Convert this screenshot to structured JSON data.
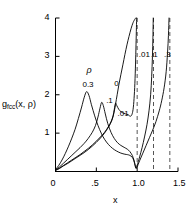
{
  "chart_data": {
    "type": "line",
    "title": "",
    "xlabel": "x",
    "ylabel": "g_fcc(x, ρ)",
    "ylabel_base": "g",
    "ylabel_sub": "fcc",
    "ylabel_args": "(x, ρ)",
    "xlim": [
      0,
      1.5
    ],
    "ylim": [
      0,
      4
    ],
    "xticks": [
      0,
      0.5,
      1.0,
      1.5
    ],
    "xtick_labels": [
      "0",
      ".5",
      "1.0",
      "1.5"
    ],
    "yticks": [
      0,
      1,
      2,
      3,
      4
    ],
    "ytick_labels": [
      "",
      "1",
      "2",
      "3",
      "4"
    ],
    "grid": false,
    "legend_position": "inline-annotations",
    "legend_title": "ρ",
    "annotations": [
      {
        "text": "ρ",
        "x": 0.38,
        "y": 2.62
      },
      {
        "text": "0.3",
        "x": 0.33,
        "y": 2.22
      },
      {
        "text": ".1",
        "x": 0.62,
        "y": 1.82
      },
      {
        "text": ".01",
        "x": 0.76,
        "y": 1.47
      },
      {
        "text": "0",
        "x": 0.72,
        "y": 2.25
      },
      {
        "text": ".01",
        "x": 1.02,
        "y": 3.02
      },
      {
        "text": ".1",
        "x": 1.17,
        "y": 3.02
      },
      {
        "text": ".3",
        "x": 1.33,
        "y": 3.02
      }
    ],
    "asymptotes": [
      {
        "label": ".01",
        "x": 1.0,
        "style": "dashed"
      },
      {
        "label": ".1",
        "x": 1.2,
        "style": "dashed"
      },
      {
        "label": ".3",
        "x": 1.4,
        "style": "dashed"
      }
    ],
    "series": [
      {
        "name": "ρ = 0.3",
        "label": "0.3",
        "rho": 0.3,
        "peak_x": 0.38,
        "peak_y": 2.08,
        "asymptote_x": 1.4,
        "points": [
          [
            0.0,
            0.05
          ],
          [
            0.04,
            0.16
          ],
          [
            0.08,
            0.3
          ],
          [
            0.12,
            0.47
          ],
          [
            0.16,
            0.66
          ],
          [
            0.2,
            0.87
          ],
          [
            0.24,
            1.1
          ],
          [
            0.28,
            1.38
          ],
          [
            0.32,
            1.68
          ],
          [
            0.35,
            1.92
          ],
          [
            0.38,
            2.08
          ],
          [
            0.41,
            1.98
          ],
          [
            0.44,
            1.74
          ],
          [
            0.48,
            1.45
          ],
          [
            0.52,
            1.2
          ],
          [
            0.56,
            1.0
          ],
          [
            0.6,
            0.84
          ],
          [
            0.65,
            0.7
          ],
          [
            0.7,
            0.6
          ],
          [
            0.75,
            0.53
          ],
          [
            0.8,
            0.48
          ],
          [
            0.85,
            0.45
          ],
          [
            0.88,
            0.44
          ],
          [
            0.91,
            0.42
          ],
          [
            0.94,
            0.37
          ],
          [
            0.96,
            0.28
          ],
          [
            0.975,
            0.15
          ],
          [
            0.985,
            0.08
          ],
          [
            1.0,
            0.12
          ],
          [
            1.03,
            0.28
          ],
          [
            1.07,
            0.48
          ],
          [
            1.11,
            0.68
          ],
          [
            1.15,
            0.88
          ],
          [
            1.19,
            1.08
          ],
          [
            1.23,
            1.3
          ],
          [
            1.27,
            1.58
          ],
          [
            1.3,
            1.84
          ],
          [
            1.33,
            2.18
          ],
          [
            1.355,
            2.6
          ],
          [
            1.372,
            3.1
          ],
          [
            1.383,
            3.55
          ],
          [
            1.39,
            4.0
          ]
        ]
      },
      {
        "name": "ρ = 0.1",
        "label": ".1",
        "rho": 0.1,
        "peak_x": 0.565,
        "peak_y": 1.8,
        "asymptote_x": 1.2,
        "points": [
          [
            0.0,
            0.04
          ],
          [
            0.05,
            0.12
          ],
          [
            0.1,
            0.22
          ],
          [
            0.15,
            0.32
          ],
          [
            0.2,
            0.42
          ],
          [
            0.25,
            0.52
          ],
          [
            0.3,
            0.62
          ],
          [
            0.35,
            0.73
          ],
          [
            0.4,
            0.86
          ],
          [
            0.45,
            1.02
          ],
          [
            0.49,
            1.2
          ],
          [
            0.52,
            1.42
          ],
          [
            0.545,
            1.65
          ],
          [
            0.565,
            1.8
          ],
          [
            0.585,
            1.72
          ],
          [
            0.61,
            1.5
          ],
          [
            0.64,
            1.25
          ],
          [
            0.68,
            1.02
          ],
          [
            0.72,
            0.86
          ],
          [
            0.76,
            0.75
          ],
          [
            0.8,
            0.68
          ],
          [
            0.84,
            0.63
          ],
          [
            0.88,
            0.58
          ],
          [
            0.91,
            0.52
          ],
          [
            0.94,
            0.42
          ],
          [
            0.96,
            0.3
          ],
          [
            0.975,
            0.17
          ],
          [
            0.985,
            0.09
          ],
          [
            1.0,
            0.16
          ],
          [
            1.03,
            0.38
          ],
          [
            1.06,
            0.62
          ],
          [
            1.09,
            0.9
          ],
          [
            1.12,
            1.22
          ],
          [
            1.145,
            1.58
          ],
          [
            1.165,
            2.0
          ],
          [
            1.178,
            2.48
          ],
          [
            1.187,
            3.0
          ],
          [
            1.193,
            3.5
          ],
          [
            1.197,
            4.0
          ]
        ]
      },
      {
        "name": "ρ = 0.01",
        "label": ".01",
        "rho": 0.01,
        "peak_x": 0.78,
        "peak_y": 1.45,
        "asymptote_x": 1.0,
        "points": [
          [
            0.0,
            0.03
          ],
          [
            0.05,
            0.09
          ],
          [
            0.1,
            0.16
          ],
          [
            0.15,
            0.23
          ],
          [
            0.2,
            0.3
          ],
          [
            0.25,
            0.37
          ],
          [
            0.3,
            0.44
          ],
          [
            0.35,
            0.52
          ],
          [
            0.4,
            0.6
          ],
          [
            0.45,
            0.69
          ],
          [
            0.5,
            0.79
          ],
          [
            0.55,
            0.9
          ],
          [
            0.6,
            1.02
          ],
          [
            0.645,
            1.16
          ],
          [
            0.68,
            1.3
          ],
          [
            0.705,
            1.45
          ],
          [
            0.72,
            1.62
          ],
          [
            0.735,
            1.78
          ],
          [
            0.75,
            1.72
          ],
          [
            0.775,
            1.62
          ],
          [
            0.8,
            1.56
          ],
          [
            0.83,
            1.52
          ],
          [
            0.86,
            1.5
          ],
          [
            0.89,
            1.48
          ],
          [
            0.915,
            1.44
          ],
          [
            0.935,
            1.48
          ],
          [
            0.95,
            1.62
          ],
          [
            0.962,
            1.9
          ],
          [
            0.972,
            2.3
          ],
          [
            0.98,
            2.8
          ],
          [
            0.986,
            3.3
          ],
          [
            0.991,
            3.75
          ],
          [
            0.994,
            4.0
          ]
        ]
      },
      {
        "name": "ρ = 0",
        "label": "0",
        "rho": 0,
        "peak_x": null,
        "peak_y": null,
        "asymptote_x": 0.985,
        "points": [
          [
            0.0,
            0.03
          ],
          [
            0.05,
            0.08
          ],
          [
            0.1,
            0.15
          ],
          [
            0.15,
            0.21
          ],
          [
            0.2,
            0.28
          ],
          [
            0.25,
            0.35
          ],
          [
            0.3,
            0.42
          ],
          [
            0.35,
            0.49
          ],
          [
            0.4,
            0.57
          ],
          [
            0.45,
            0.66
          ],
          [
            0.5,
            0.76
          ],
          [
            0.55,
            0.87
          ],
          [
            0.6,
            1.0
          ],
          [
            0.65,
            1.16
          ],
          [
            0.69,
            1.33
          ],
          [
            0.715,
            1.52
          ],
          [
            0.735,
            1.75
          ],
          [
            0.755,
            2.0
          ],
          [
            0.775,
            2.25
          ],
          [
            0.8,
            2.52
          ],
          [
            0.825,
            2.78
          ],
          [
            0.85,
            3.05
          ],
          [
            0.875,
            3.3
          ],
          [
            0.9,
            3.52
          ],
          [
            0.925,
            3.72
          ],
          [
            0.95,
            3.88
          ],
          [
            0.97,
            3.96
          ],
          [
            0.982,
            4.0
          ]
        ]
      }
    ]
  },
  "axes": {
    "x_axis_name": "x",
    "y_axis_name": "g_fcc(x, ρ)"
  }
}
